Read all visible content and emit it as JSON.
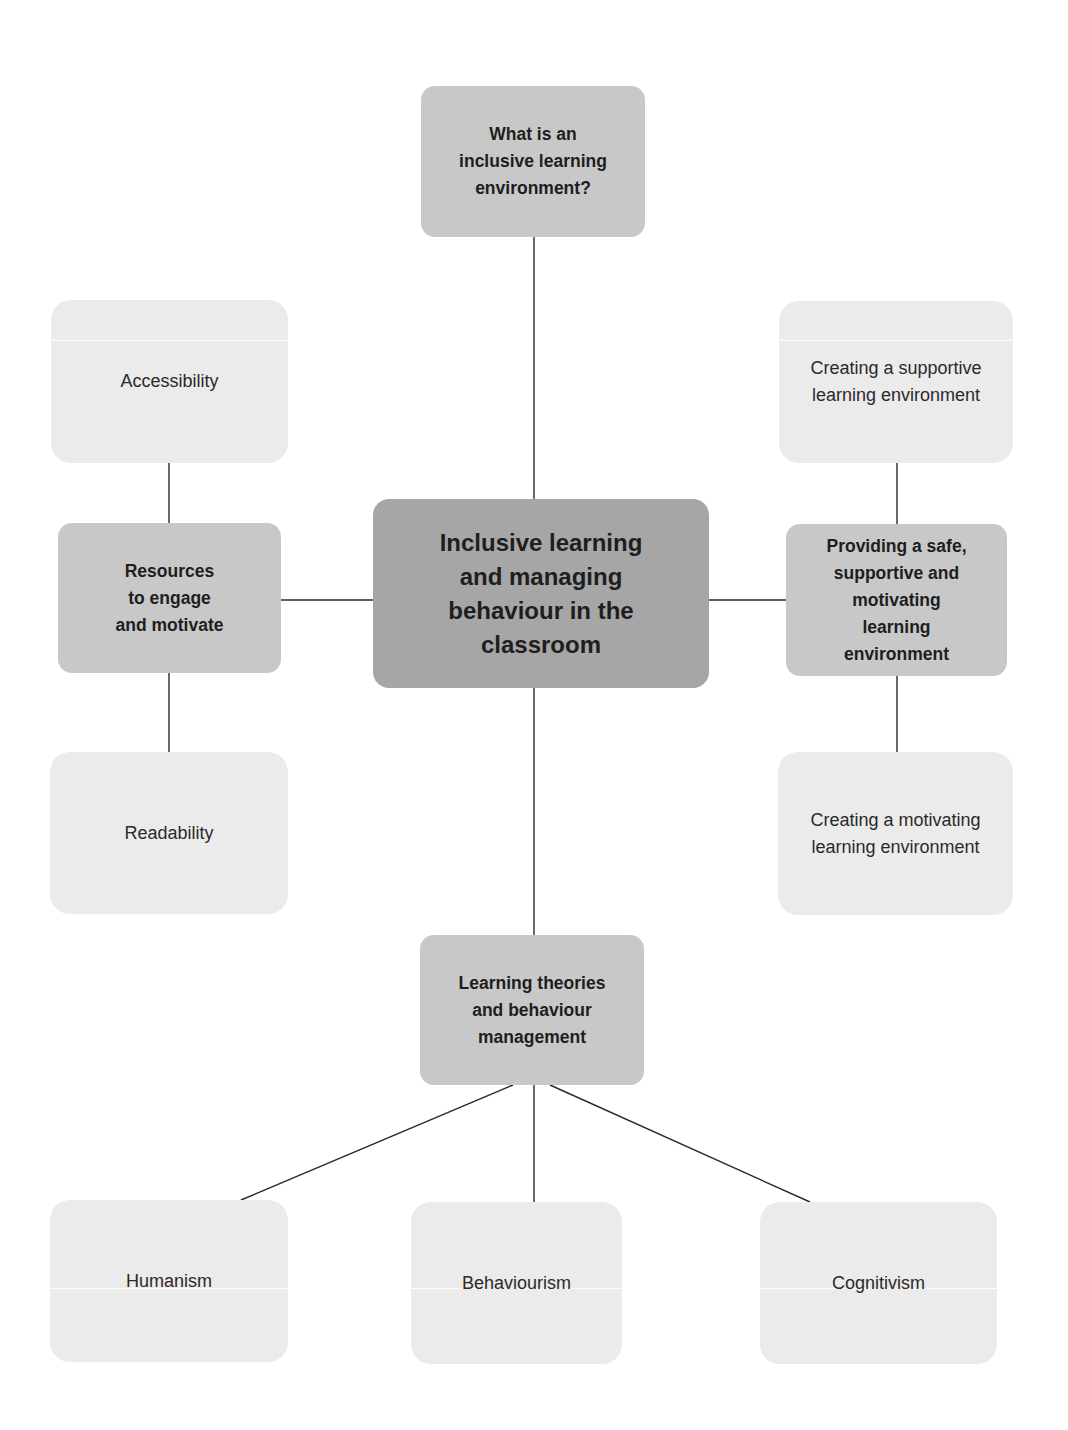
{
  "diagram": {
    "type": "mind-map",
    "colors": {
      "root_fill": "#a6a6a6",
      "branch_fill": "#c8c8c8",
      "leaf_fill": "#ebebeb",
      "connector": "#2a2a2a",
      "text": "#1e1e1e"
    },
    "root": {
      "label": "Inclusive learning and managing behaviour in the classroom",
      "lines": [
        "Inclusive learning",
        "and managing",
        "behaviour in the",
        "classroom"
      ]
    },
    "branches": {
      "top": {
        "label": "What is an inclusive learning environment?",
        "lines": [
          "What is an",
          "inclusive learning",
          "environment?"
        ]
      },
      "left": {
        "label": "Resources to engage and motivate",
        "lines": [
          "Resources",
          "to engage",
          "and motivate"
        ],
        "children": [
          {
            "label": "Accessibility"
          },
          {
            "label": "Readability"
          }
        ]
      },
      "right": {
        "label": "Providing a safe, supportive and motivating learning environment",
        "lines": [
          "Providing a safe,",
          "supportive and",
          "motivating",
          "learning",
          "environment"
        ],
        "children": [
          {
            "label": "Creating a supportive learning environment",
            "lines": [
              "Creating a supportive",
              "learning environment"
            ]
          },
          {
            "label": "Creating a motivating learning environment",
            "lines": [
              "Creating a motivating",
              "learning environment"
            ]
          }
        ]
      },
      "bottom": {
        "label": "Learning theories and behaviour management",
        "lines": [
          "Learning theories",
          "and behaviour",
          "management"
        ],
        "children": [
          {
            "label": "Humanism"
          },
          {
            "label": "Behaviourism"
          },
          {
            "label": "Cognitivism"
          }
        ]
      }
    }
  }
}
